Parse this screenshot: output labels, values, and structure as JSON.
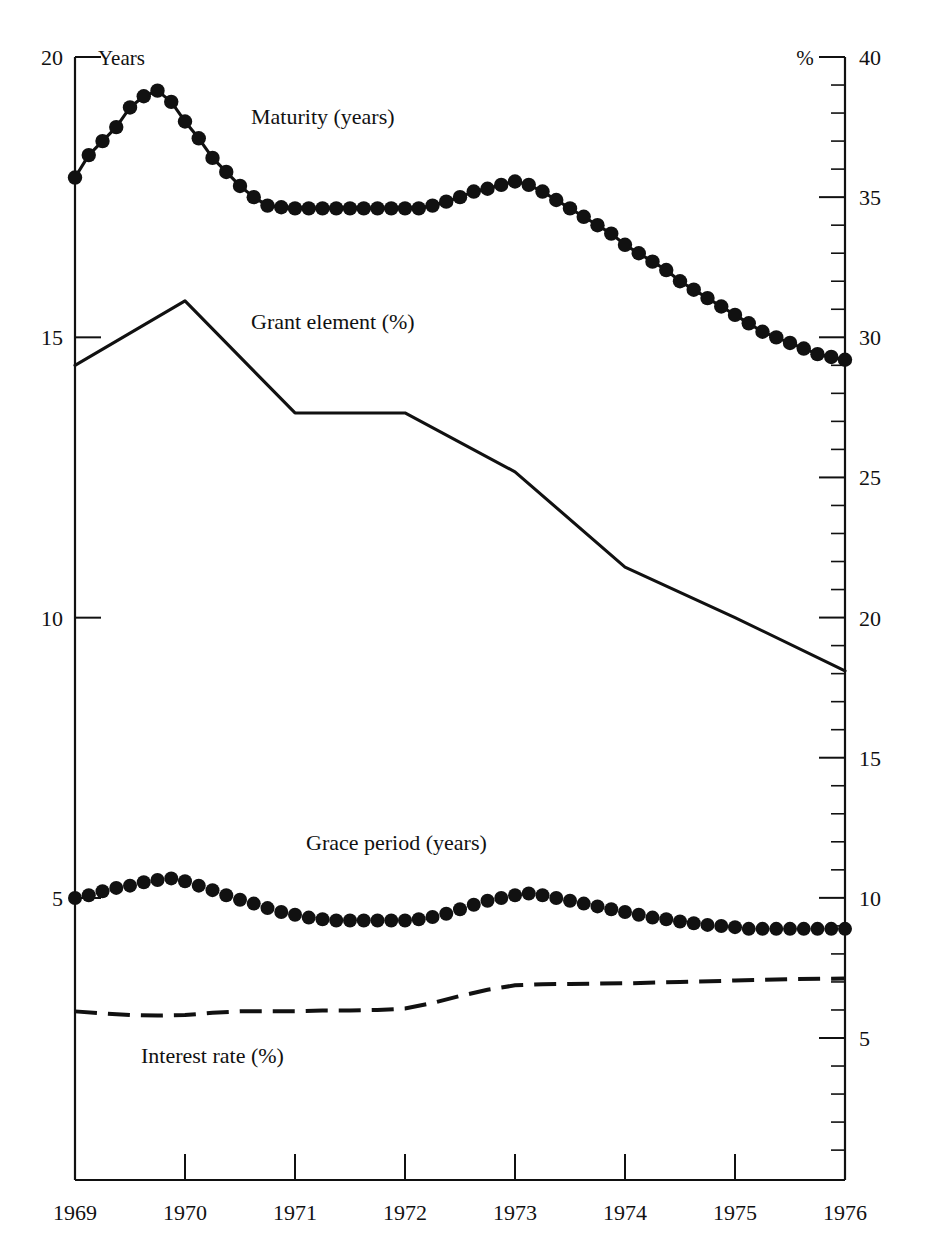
{
  "axes": {
    "left": {
      "unit_label": "Years",
      "ticks": [
        20,
        15,
        10,
        5
      ],
      "min": 0,
      "max": 20
    },
    "right": {
      "unit_label": "%",
      "ticks": [
        40,
        35,
        30,
        25,
        20,
        15,
        10,
        5
      ],
      "min": 0,
      "max": 40,
      "minor_step": 1
    },
    "x": {
      "ticks": [
        "1969",
        "1970",
        "1971",
        "1972",
        "1973",
        "1974",
        "1975",
        "1976"
      ],
      "min": 1969,
      "max": 1976
    }
  },
  "series_labels": {
    "maturity": "Maturity (years)",
    "grant_element": "Grant element (%)",
    "grace_period": "Grace period (years)",
    "interest_rate": "Interest rate (%)"
  },
  "chart_data": {
    "type": "line",
    "title": "",
    "xlabel": "",
    "ylabel": "Years",
    "y2label": "%",
    "xlim": [
      1969,
      1976
    ],
    "ylim": [
      0,
      20
    ],
    "y2lim": [
      0,
      40
    ],
    "grid": false,
    "legend": "inline-annotations",
    "annotations": [
      {
        "text": "Maturity (years)",
        "x": 1970.6,
        "y_axis": "left",
        "y": 18.8
      },
      {
        "text": "Grant element (%)",
        "x": 1970.6,
        "y_axis": "right",
        "y": 30.3
      },
      {
        "text": "Grace period (years)",
        "x": 1971.1,
        "y_axis": "left",
        "y": 5.85
      },
      {
        "text": "Interest rate (%)",
        "x": 1969.6,
        "y_axis": "left",
        "y": 2.05
      }
    ],
    "series": [
      {
        "name": "Maturity (years)",
        "axis": "left",
        "unit": "years",
        "style": "line-with-round-markers",
        "x": [
          1969.0,
          1969.125,
          1969.25,
          1969.375,
          1969.5,
          1969.625,
          1969.75,
          1969.875,
          1970.0,
          1970.125,
          1970.25,
          1970.375,
          1970.5,
          1970.625,
          1970.75,
          1970.875,
          1971.0,
          1971.125,
          1971.25,
          1971.375,
          1971.5,
          1971.625,
          1971.75,
          1971.875,
          1972.0,
          1972.125,
          1972.25,
          1972.375,
          1972.5,
          1972.625,
          1972.75,
          1972.875,
          1973.0,
          1973.125,
          1973.25,
          1973.375,
          1973.5,
          1973.625,
          1973.75,
          1973.875,
          1974.0,
          1974.125,
          1974.25,
          1974.375,
          1974.5,
          1974.625,
          1974.75,
          1974.875,
          1975.0,
          1975.125,
          1975.25,
          1975.375,
          1975.5,
          1975.625,
          1975.75,
          1975.875,
          1976.0
        ],
        "values": [
          17.85,
          18.25,
          18.5,
          18.75,
          19.1,
          19.3,
          19.4,
          19.2,
          18.85,
          18.55,
          18.2,
          17.95,
          17.7,
          17.5,
          17.35,
          17.32,
          17.3,
          17.3,
          17.3,
          17.3,
          17.3,
          17.3,
          17.3,
          17.3,
          17.3,
          17.3,
          17.35,
          17.42,
          17.5,
          17.6,
          17.65,
          17.72,
          17.78,
          17.72,
          17.6,
          17.45,
          17.3,
          17.15,
          17.0,
          16.85,
          16.65,
          16.5,
          16.35,
          16.2,
          16.0,
          15.85,
          15.7,
          15.55,
          15.4,
          15.25,
          15.1,
          15.0,
          14.9,
          14.8,
          14.7,
          14.65,
          14.6
        ]
      },
      {
        "name": "Grant element (%)",
        "axis": "right",
        "unit": "percent",
        "style": "solid-line",
        "x": [
          1969.0,
          1970.0,
          1971.0,
          1972.0,
          1973.0,
          1974.0,
          1975.0,
          1976.0
        ],
        "values": [
          29.0,
          31.3,
          27.3,
          27.3,
          25.2,
          21.8,
          20.0,
          18.1
        ]
      },
      {
        "name": "Grace period (years)",
        "axis": "left",
        "unit": "years",
        "style": "dotted-markers",
        "x": [
          1969.0,
          1969.125,
          1969.25,
          1969.375,
          1969.5,
          1969.625,
          1969.75,
          1969.875,
          1970.0,
          1970.125,
          1970.25,
          1970.375,
          1970.5,
          1970.625,
          1970.75,
          1970.875,
          1971.0,
          1971.125,
          1971.25,
          1971.375,
          1971.5,
          1971.625,
          1971.75,
          1971.875,
          1972.0,
          1972.125,
          1972.25,
          1972.375,
          1972.5,
          1972.625,
          1972.75,
          1972.875,
          1973.0,
          1973.125,
          1973.25,
          1973.375,
          1973.5,
          1973.625,
          1973.75,
          1973.875,
          1974.0,
          1974.125,
          1974.25,
          1974.375,
          1974.5,
          1974.625,
          1974.75,
          1974.875,
          1975.0,
          1975.125,
          1975.25,
          1975.375,
          1975.5,
          1975.625,
          1975.75,
          1975.875,
          1976.0
        ],
        "values": [
          5.0,
          5.05,
          5.12,
          5.18,
          5.22,
          5.28,
          5.32,
          5.35,
          5.3,
          5.22,
          5.14,
          5.05,
          4.97,
          4.9,
          4.82,
          4.75,
          4.7,
          4.65,
          4.62,
          4.6,
          4.6,
          4.6,
          4.6,
          4.6,
          4.6,
          4.62,
          4.66,
          4.72,
          4.8,
          4.88,
          4.95,
          5.0,
          5.05,
          5.08,
          5.05,
          5.0,
          4.95,
          4.9,
          4.85,
          4.8,
          4.75,
          4.7,
          4.65,
          4.62,
          4.58,
          4.55,
          4.52,
          4.5,
          4.48,
          4.45,
          4.45,
          4.45,
          4.45,
          4.45,
          4.45,
          4.45,
          4.45
        ]
      },
      {
        "name": "Interest rate (%)",
        "axis": "right",
        "unit": "percent",
        "style": "dashed-line",
        "x": [
          1969.0,
          1969.25,
          1969.5,
          1969.75,
          1970.0,
          1970.25,
          1970.5,
          1970.75,
          1971.0,
          1971.25,
          1971.5,
          1971.75,
          1972.0,
          1972.25,
          1972.5,
          1972.75,
          1973.0,
          1973.25,
          1973.5,
          1973.75,
          1974.0,
          1974.5,
          1975.0,
          1975.5,
          1976.0
        ],
        "values": [
          5.95,
          5.88,
          5.82,
          5.8,
          5.82,
          5.9,
          5.95,
          5.95,
          5.95,
          5.98,
          5.98,
          6.0,
          6.05,
          6.25,
          6.5,
          6.72,
          6.88,
          6.92,
          6.93,
          6.94,
          6.95,
          7.0,
          7.05,
          7.1,
          7.12
        ]
      }
    ]
  }
}
